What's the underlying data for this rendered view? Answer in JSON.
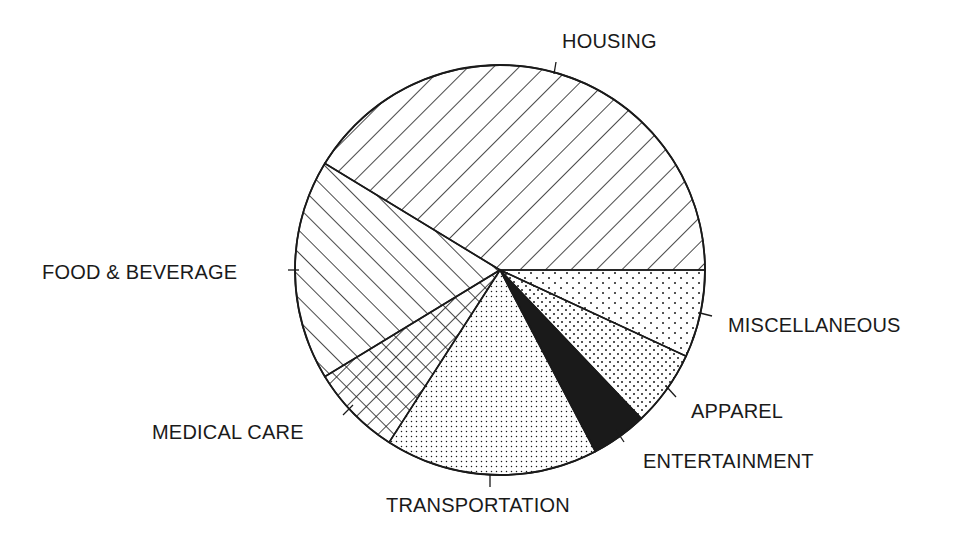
{
  "chart_data": {
    "type": "pie",
    "title": "",
    "unit": "percent (estimated from slice angles)",
    "center": [
      500,
      270
    ],
    "radius": 205,
    "start_angle_deg": 0,
    "direction": "clockwise",
    "slices": [
      {
        "label": "MISCELLANEOUS",
        "value": 6.9,
        "pattern": "sparse-dots",
        "label_pos": [
          728,
          332
        ],
        "tick": [
          [
            700,
            313
          ],
          [
            712,
            316
          ]
        ]
      },
      {
        "label": "APPAREL",
        "value": 6.0,
        "pattern": "medium-dots",
        "label_pos": [
          691,
          418
        ],
        "tick": [
          [
            666,
            386
          ],
          [
            676,
            397
          ]
        ]
      },
      {
        "label": "ENTERTAINMENT",
        "value": 4.4,
        "pattern": "solid-black",
        "label_pos": [
          643,
          468
        ],
        "tick": [
          [
            616,
            430
          ],
          [
            624,
            442
          ]
        ]
      },
      {
        "label": "TRANSPORTATION",
        "value": 16.8,
        "pattern": "fine-dots",
        "label_pos": [
          386,
          512
        ],
        "tick": [
          [
            490,
            475
          ],
          [
            490,
            487
          ]
        ]
      },
      {
        "label": "MEDICAL CARE",
        "value": 7.2,
        "pattern": "crosshatch",
        "label_pos": [
          152,
          439
        ],
        "tick": [
          [
            353,
            405
          ],
          [
            343,
            415
          ]
        ]
      },
      {
        "label": "FOOD & BEVERAGE",
        "value": 17.4,
        "pattern": "hatch-down",
        "label_pos": [
          42,
          279
        ],
        "tick": [
          [
            288,
            270
          ],
          [
            299,
            270
          ]
        ]
      },
      {
        "label": "HOUSING",
        "value": 41.3,
        "pattern": "hatch-up",
        "label_pos": [
          562,
          48
        ],
        "tick": [
          [
            556,
            62
          ],
          [
            554,
            74
          ]
        ]
      }
    ],
    "legend": "none (direct labels with leader ticks)",
    "colors": {
      "ink": "#1a1a1a",
      "background": "#ffffff"
    }
  }
}
